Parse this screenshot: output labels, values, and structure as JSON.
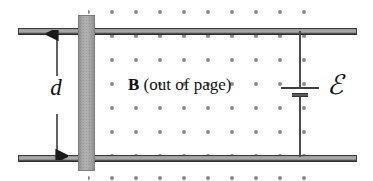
{
  "figure": {
    "background_color": "#ffffff"
  },
  "labels": {
    "separation": "d",
    "field_symbol": "B",
    "field_note": "(out of page)",
    "emf": "ℰ"
  },
  "elements": {
    "rail_top": {
      "name": "top conducting rail"
    },
    "rail_bottom": {
      "name": "bottom conducting rail"
    },
    "slider_bar": {
      "name": "sliding conductor bar"
    },
    "dimension_arrow": {
      "name": "separation dimension arrow",
      "measures": "d"
    },
    "battery": {
      "name": "emf source",
      "positive_terminal": "long plate",
      "negative_terminal": "short plate"
    },
    "field_dots": {
      "name": "magnetic field dots",
      "direction": "out of page"
    }
  },
  "colors": {
    "rail_fill": "#adadad",
    "rail_outline": "#2e2e2e",
    "bar_fill": "#b3b3b3",
    "bar_outline": "#7d7d7d",
    "dot": "#8c8c8c",
    "wire": "#4a4a4a",
    "text": "#111111"
  },
  "chart_data": {
    "type": "diagram",
    "field": {
      "symbol": "B",
      "annotation": "(out of page)",
      "dot_grid": {
        "columns_x": [
          0,
          24,
          48,
          72,
          96,
          120,
          144,
          168,
          192,
          216
        ],
        "rows_y": [
          8,
          32,
          56,
          80,
          104,
          128,
          152,
          174
        ],
        "dot_radius_px": 2,
        "color": "#8c8c8c"
      }
    },
    "rails": [
      {
        "id": "rail-top",
        "x1": 18,
        "x2": 357,
        "y": 31
      },
      {
        "id": "rail-bottom",
        "x1": 18,
        "x2": 357,
        "y": 158
      }
    ],
    "slider_bar": {
      "x": 78,
      "y_top": 15,
      "y_bottom": 171,
      "width": 17
    },
    "dimension": {
      "label": "d",
      "x": 57,
      "y_top": 30,
      "y_bottom": 160
    },
    "circuit": {
      "wire_x": 300,
      "battery_y": 90,
      "emf_label": "ℰ"
    }
  }
}
